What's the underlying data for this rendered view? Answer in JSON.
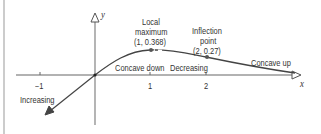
{
  "diagram": {
    "function_description": "Graph of a curve passing through origin, increasing then decreasing, with local maximum and inflection point",
    "axes": {
      "x_label": "x",
      "y_label": "y",
      "x_ticks": [
        "−1",
        "1",
        "2"
      ]
    },
    "annotations": {
      "local_max_line1": "Local",
      "local_max_line2": "maximum",
      "local_max_coords": "(1, 0.368)",
      "inflection_line1": "Inflection",
      "inflection_line2": "point",
      "inflection_coords": "(2, 0.27)",
      "concave_down": "Concave down",
      "decreasing": "Decreasing",
      "concave_up": "Concave up",
      "increasing": "Increasing"
    },
    "points": [
      {
        "name": "local-maximum",
        "x": 1,
        "y": 0.368
      },
      {
        "name": "inflection-point",
        "x": 2,
        "y": 0.27
      }
    ],
    "colors": {
      "axis": "#555555",
      "curve": "#444444",
      "point": "#555555",
      "text": "#333333",
      "border": "#999999"
    }
  }
}
